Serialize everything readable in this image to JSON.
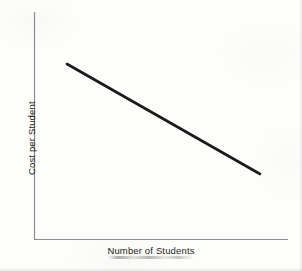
{
  "figure": {
    "background_color": "#fdfdfc",
    "width": 302,
    "height": 271
  },
  "chart_data": {
    "type": "line",
    "title": "",
    "subtitle": "",
    "xlabel": "Number of Students",
    "ylabel": "Cost per Student",
    "grid": false,
    "legend": null,
    "legend_position": "none",
    "x_tick_labels": [],
    "y_tick_labels": [],
    "xlim": [
      0,
      1
    ],
    "ylim": [
      0,
      1
    ],
    "annotations": [],
    "series": [
      {
        "name": "Cost per Student",
        "color": "#1a1a1a",
        "line_width": 2.6,
        "x": [
          0.13,
          1.0
        ],
        "y": [
          0.77,
          0.29
        ],
        "points_px": [
          {
            "x": 67,
            "y": 64
          },
          {
            "x": 260,
            "y": 174
          }
        ]
      }
    ],
    "axes": {
      "color": "#8c8c8c",
      "line_width": 1,
      "x_axis_px": {
        "x1": 34,
        "y1": 239,
        "x2": 288,
        "y2": 239
      },
      "y_axis_px": {
        "x1": 34,
        "y1": 12,
        "x2": 34,
        "y2": 239
      }
    }
  }
}
